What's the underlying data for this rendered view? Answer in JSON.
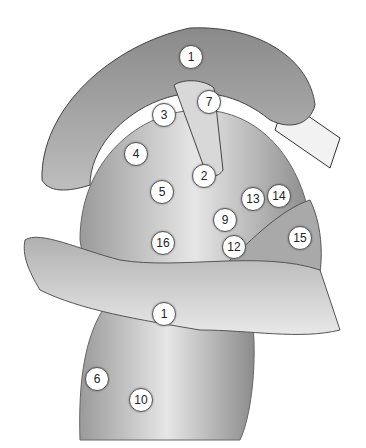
{
  "figure": {
    "type": "anatomical-illustration",
    "style": "grayscale muscle drawing",
    "labels": [
      {
        "n": "1",
        "x": 190,
        "y": 56
      },
      {
        "n": "7",
        "x": 208,
        "y": 101
      },
      {
        "n": "3",
        "x": 163,
        "y": 114
      },
      {
        "n": "4",
        "x": 135,
        "y": 153
      },
      {
        "n": "2",
        "x": 203,
        "y": 175
      },
      {
        "n": "5",
        "x": 161,
        "y": 191
      },
      {
        "n": "13",
        "x": 252,
        "y": 198
      },
      {
        "n": "14",
        "x": 278,
        "y": 195
      },
      {
        "n": "9",
        "x": 224,
        "y": 219
      },
      {
        "n": "12",
        "x": 233,
        "y": 246
      },
      {
        "n": "16",
        "x": 162,
        "y": 242
      },
      {
        "n": "15",
        "x": 299,
        "y": 237
      },
      {
        "n": "1",
        "x": 163,
        "y": 313
      },
      {
        "n": "6",
        "x": 96,
        "y": 378
      },
      {
        "n": "10",
        "x": 140,
        "y": 399
      }
    ]
  }
}
